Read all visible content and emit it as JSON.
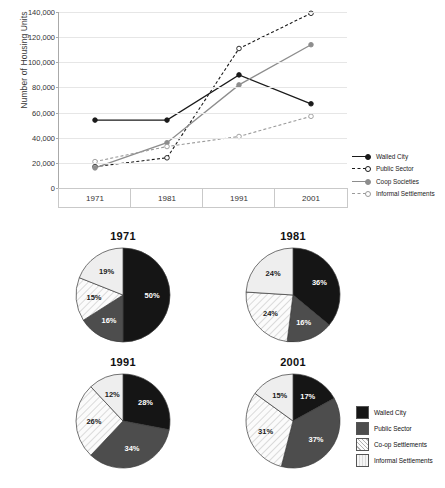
{
  "chart_data": [
    {
      "type": "line",
      "title": "",
      "xlabel": "",
      "ylabel": "Number of Housing Units",
      "categories": [
        "1971",
        "1981",
        "1991",
        "2001"
      ],
      "ylim": [
        0,
        140000
      ],
      "yticks": [
        "0",
        "20,000",
        "40,000",
        "60,000",
        "80,000",
        "100,000",
        "120,000",
        "140,000"
      ],
      "ytick_values": [
        0,
        20000,
        40000,
        60000,
        80000,
        100000,
        120000,
        140000
      ],
      "grid": true,
      "legend_position": "right",
      "series": [
        {
          "name": "Walled City",
          "values": [
            54000,
            54000,
            90000,
            67000
          ],
          "color": "#1a1a1a",
          "dash": "solid",
          "marker": "filled-circle"
        },
        {
          "name": "Public Sector",
          "values": [
            17000,
            24000,
            111000,
            139000
          ],
          "color": "#1a1a1a",
          "dash": "dashed",
          "marker": "open-circle"
        },
        {
          "name": "Coop Societies",
          "values": [
            16000,
            36000,
            82000,
            114000
          ],
          "color": "#8d8d8d",
          "dash": "solid",
          "marker": "filled-circle"
        },
        {
          "name": "Informal Settlements",
          "values": [
            21000,
            33000,
            41000,
            57000
          ],
          "color": "#9a9a9a",
          "dash": "dashed",
          "marker": "open-circle"
        }
      ]
    },
    {
      "type": "pie",
      "title": "1971",
      "labels": [
        "Walled City",
        "Public Sector",
        "Co-op Settlements",
        "Informal Settlements"
      ],
      "values": [
        50,
        16,
        15,
        19
      ],
      "value_labels": [
        "50%",
        "16%",
        "15%",
        "19%"
      ]
    },
    {
      "type": "pie",
      "title": "1981",
      "labels": [
        "Walled City",
        "Public Sector",
        "Co-op Settlements",
        "Informal Settlements"
      ],
      "values": [
        36,
        16,
        24,
        24
      ],
      "value_labels": [
        "36%",
        "16%",
        "24%",
        "24%"
      ]
    },
    {
      "type": "pie",
      "title": "1991",
      "labels": [
        "Walled City",
        "Public Sector",
        "Co-op Settlements",
        "Informal Settlements"
      ],
      "values": [
        28,
        34,
        26,
        12
      ],
      "value_labels": [
        "28%",
        "34%",
        "26%",
        "12%"
      ]
    },
    {
      "type": "pie",
      "title": "2001",
      "labels": [
        "Walled City",
        "Public Sector",
        "Co-op Settlements",
        "Informal Settlements"
      ],
      "values": [
        17,
        37,
        31,
        15
      ],
      "value_labels": [
        "17%",
        "37%",
        "31%",
        "15%"
      ]
    }
  ],
  "line_chart": {
    "ylabel": "Number of Housing Units",
    "yticks": [
      "140,000",
      "120,000",
      "100,000",
      "80,000",
      "60,000",
      "40,000",
      "20,000",
      "0"
    ],
    "xticks": [
      "1971",
      "1981",
      "1991",
      "2001"
    ],
    "legend": [
      {
        "label": "Walled City"
      },
      {
        "label": "Public Sector"
      },
      {
        "label": "Coop Societies"
      },
      {
        "label": "Informal Settlements"
      }
    ]
  },
  "pie_section": {
    "charts": [
      {
        "title": "1971",
        "slices": [
          "50%",
          "16%",
          "15%",
          "19%"
        ]
      },
      {
        "title": "1981",
        "slices": [
          "36%",
          "16%",
          "24%",
          "24%"
        ]
      },
      {
        "title": "1991",
        "slices": [
          "28%",
          "34%",
          "26%",
          "12%"
        ]
      },
      {
        "title": "2001",
        "slices": [
          "17%",
          "37%",
          "31%",
          "15%"
        ]
      }
    ],
    "legend": [
      {
        "label": "Walled City",
        "swatch": "solid-black"
      },
      {
        "label": "Public Sector",
        "swatch": "solid-darkgray"
      },
      {
        "label": "Co-op Settlements",
        "swatch": "diagonal-hatch"
      },
      {
        "label": "Informal Settlements",
        "swatch": "light-gray"
      }
    ]
  },
  "colors": {
    "walled_city": "#151515",
    "public_sector": "#4d4d4d",
    "coop": "#f2f2f2",
    "informal": "#eeeeee",
    "grid": "#e6e6e6",
    "axis": "#aaaaaa"
  }
}
